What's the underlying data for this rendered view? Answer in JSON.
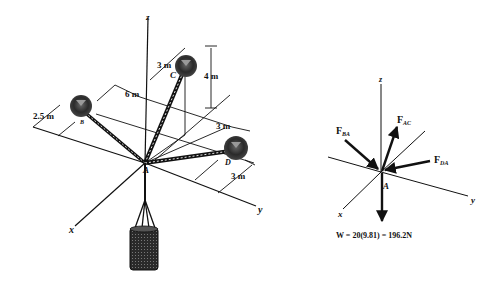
{
  "figure": {
    "left_diagram": {
      "title": "Space diagram",
      "axes": {
        "x": "x",
        "y": "y",
        "z": "z"
      },
      "points": {
        "A": "A",
        "B": "B",
        "C": "C",
        "D": "D"
      },
      "dimensions": {
        "d_2_5": "2.5 m",
        "d_6": "6 m",
        "d_3_c": "3 m",
        "d_4": "4 m",
        "d_3_d1": "3 m",
        "d_3_d2": "3 m"
      },
      "load": "cylinder"
    },
    "right_diagram": {
      "title": "Free-body diagram",
      "axes": {
        "x": "x",
        "y": "y",
        "z": "z"
      },
      "point": "A",
      "forces": {
        "f_ba": {
          "main": "F",
          "sub": "BA"
        },
        "f_ac": {
          "main": "F",
          "sub": "AC"
        },
        "f_da": {
          "main": "F",
          "sub": "DA"
        }
      },
      "weight": "W = 20(9.81) = 196.2N"
    },
    "colors": {
      "ink": "#111111",
      "background": "#ffffff",
      "balloon": "#333333"
    }
  }
}
